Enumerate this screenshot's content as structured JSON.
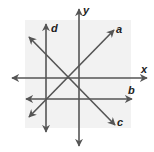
{
  "figure": {
    "background_color": "#ffffff",
    "panel_color": "#f2f2f2",
    "line_color": "#555555",
    "panel": {
      "x": 25,
      "y": 20,
      "width": 106,
      "height": 108
    }
  },
  "axes": {
    "x": {
      "label": "x",
      "x1": 12,
      "y1": 78,
      "x2": 147,
      "y2": 78,
      "label_x": 141,
      "label_y": 73
    },
    "y": {
      "label": "y",
      "x1": 79,
      "y1": 146,
      "x2": 79,
      "y2": 9,
      "label_x": 83,
      "label_y": 14
    }
  },
  "lines": [
    {
      "name": "a",
      "label": "a",
      "x1": 29,
      "y1": 117,
      "x2": 114,
      "y2": 30,
      "label_x": 116,
      "label_y": 33,
      "arrows": "both"
    },
    {
      "name": "b",
      "label": "b",
      "x1": 26,
      "y1": 99,
      "x2": 132,
      "y2": 99,
      "label_x": 128,
      "label_y": 94,
      "arrows": "both"
    },
    {
      "name": "c",
      "label": "c",
      "x1": 29,
      "y1": 37,
      "x2": 115,
      "y2": 125,
      "label_x": 117,
      "label_y": 126,
      "arrows": "both"
    },
    {
      "name": "d",
      "label": "d",
      "x1": 46,
      "y1": 132,
      "x2": 46,
      "y2": 24,
      "label_x": 51,
      "label_y": 32,
      "arrows": "both"
    }
  ]
}
